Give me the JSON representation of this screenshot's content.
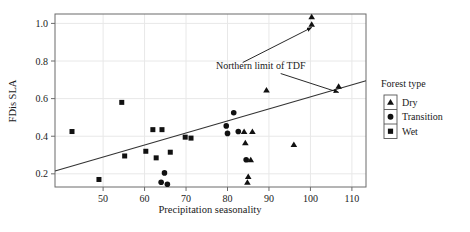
{
  "chart_data": {
    "type": "scatter",
    "title": "",
    "xlabel": "Precipitation seasonality",
    "ylabel": "FDis SLA",
    "xlim": [
      38.4,
      113.4
    ],
    "ylim": [
      0.13,
      1.05
    ],
    "xticks": [
      50,
      60,
      70,
      80,
      90,
      100,
      110
    ],
    "xticklabels": [
      "50",
      "60",
      "70",
      "80",
      "90",
      "100",
      "110"
    ],
    "yticks": [
      0.2,
      0.4,
      0.6,
      0.8,
      1.0
    ],
    "yticklabels": [
      "0.2",
      "0.4",
      "0.6",
      "0.8",
      "1.0"
    ],
    "grid": true,
    "grid_color": "#e8e8e8",
    "marker_color": "#111111",
    "legend": {
      "title": "Forest type",
      "position": "right-outside",
      "entries": [
        {
          "label": "Dry",
          "marker": "triangle"
        },
        {
          "label": "Transition",
          "marker": "circle"
        },
        {
          "label": "Wet",
          "marker": "square"
        }
      ]
    },
    "trendline": {
      "type": "line",
      "x": [
        38.4,
        113.4
      ],
      "y": [
        0.215,
        0.695
      ],
      "color": "#333333"
    },
    "annotations": [
      {
        "text": "Northern limit of TDF",
        "x": 88.0,
        "y": 0.76,
        "arrows": [
          {
            "to_x": 100.3,
            "to_y": 1.01
          },
          {
            "to_x": 106.8,
            "to_y": 0.665
          }
        ]
      }
    ],
    "series": [
      {
        "name": "Dry",
        "marker": "triangle",
        "points": [
          {
            "x": 100.3,
            "y": 1.035
          },
          {
            "x": 100.3,
            "y": 0.995
          },
          {
            "x": 106.8,
            "y": 0.665
          },
          {
            "x": 89.4,
            "y": 0.645
          },
          {
            "x": 84.0,
            "y": 0.425
          },
          {
            "x": 86.0,
            "y": 0.425
          },
          {
            "x": 96.0,
            "y": 0.355
          },
          {
            "x": 84.3,
            "y": 0.365
          },
          {
            "x": 85.6,
            "y": 0.275
          },
          {
            "x": 85.0,
            "y": 0.185
          },
          {
            "x": 84.8,
            "y": 0.155
          }
        ]
      },
      {
        "name": "Transition",
        "marker": "circle",
        "points": [
          {
            "x": 81.5,
            "y": 0.525
          },
          {
            "x": 79.7,
            "y": 0.455
          },
          {
            "x": 80.0,
            "y": 0.415
          },
          {
            "x": 82.6,
            "y": 0.425
          },
          {
            "x": 84.5,
            "y": 0.275
          },
          {
            "x": 64.8,
            "y": 0.205
          },
          {
            "x": 64.0,
            "y": 0.155
          },
          {
            "x": 65.5,
            "y": 0.145
          }
        ]
      },
      {
        "name": "Wet",
        "marker": "square",
        "points": [
          {
            "x": 54.5,
            "y": 0.58
          },
          {
            "x": 62.0,
            "y": 0.435
          },
          {
            "x": 64.2,
            "y": 0.435
          },
          {
            "x": 42.5,
            "y": 0.425
          },
          {
            "x": 69.8,
            "y": 0.395
          },
          {
            "x": 71.2,
            "y": 0.39
          },
          {
            "x": 60.3,
            "y": 0.32
          },
          {
            "x": 66.2,
            "y": 0.315
          },
          {
            "x": 55.2,
            "y": 0.295
          },
          {
            "x": 62.8,
            "y": 0.285
          },
          {
            "x": 49.0,
            "y": 0.17
          }
        ]
      }
    ]
  }
}
